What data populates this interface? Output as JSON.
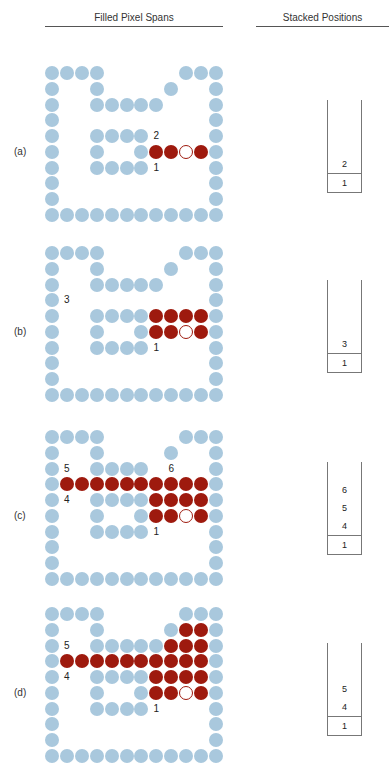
{
  "headers": {
    "left": "Filled Pixel Spans",
    "right": "Stacked Positions"
  },
  "colors": {
    "boundary": "#a9c8dd",
    "filled": "#9e1a0e",
    "seed_outline": "#9e1a0e"
  },
  "grid": {
    "cols": 12,
    "rows": 10
  },
  "boundary_pixels": [
    [
      0,
      0
    ],
    [
      0,
      1
    ],
    [
      0,
      2
    ],
    [
      0,
      3
    ],
    [
      0,
      9
    ],
    [
      0,
      10
    ],
    [
      0,
      11
    ],
    [
      1,
      0
    ],
    [
      1,
      3
    ],
    [
      1,
      8
    ],
    [
      1,
      11
    ],
    [
      2,
      0
    ],
    [
      2,
      3
    ],
    [
      2,
      4
    ],
    [
      2,
      5
    ],
    [
      2,
      6
    ],
    [
      2,
      7
    ],
    [
      2,
      11
    ],
    [
      3,
      0
    ],
    [
      3,
      11
    ],
    [
      4,
      0
    ],
    [
      4,
      3
    ],
    [
      4,
      4
    ],
    [
      4,
      5
    ],
    [
      4,
      6
    ],
    [
      4,
      11
    ],
    [
      5,
      0
    ],
    [
      5,
      3
    ],
    [
      5,
      6
    ],
    [
      5,
      11
    ],
    [
      6,
      0
    ],
    [
      6,
      3
    ],
    [
      6,
      4
    ],
    [
      6,
      5
    ],
    [
      6,
      6
    ],
    [
      6,
      11
    ],
    [
      7,
      0
    ],
    [
      7,
      11
    ],
    [
      8,
      0
    ],
    [
      8,
      11
    ],
    [
      9,
      0
    ],
    [
      9,
      1
    ],
    [
      9,
      2
    ],
    [
      9,
      3
    ],
    [
      9,
      4
    ],
    [
      9,
      5
    ],
    [
      9,
      6
    ],
    [
      9,
      7
    ],
    [
      9,
      8
    ],
    [
      9,
      9
    ],
    [
      9,
      10
    ],
    [
      9,
      11
    ]
  ],
  "panels": [
    {
      "label": "(a)",
      "filled": [
        [
          5,
          7
        ],
        [
          5,
          8
        ],
        [
          5,
          10
        ]
      ],
      "seed": [
        5,
        9
      ],
      "markers": [
        {
          "text": "2",
          "row": 4,
          "col": 7
        },
        {
          "text": "1",
          "row": 6,
          "col": 7
        }
      ],
      "stack": [
        "2",
        "1"
      ]
    },
    {
      "label": "(b)",
      "filled": [
        [
          4,
          7
        ],
        [
          4,
          8
        ],
        [
          4,
          9
        ],
        [
          4,
          10
        ],
        [
          5,
          7
        ],
        [
          5,
          8
        ],
        [
          5,
          10
        ]
      ],
      "seed": [
        5,
        9
      ],
      "markers": [
        {
          "text": "3",
          "row": 3,
          "col": 1
        },
        {
          "text": "1",
          "row": 6,
          "col": 7
        }
      ],
      "stack": [
        "3",
        "1"
      ]
    },
    {
      "label": "(c)",
      "filled": [
        [
          3,
          1
        ],
        [
          3,
          2
        ],
        [
          3,
          3
        ],
        [
          3,
          4
        ],
        [
          3,
          5
        ],
        [
          3,
          6
        ],
        [
          3,
          7
        ],
        [
          3,
          8
        ],
        [
          3,
          9
        ],
        [
          3,
          10
        ],
        [
          4,
          7
        ],
        [
          4,
          8
        ],
        [
          4,
          9
        ],
        [
          4,
          10
        ],
        [
          5,
          7
        ],
        [
          5,
          8
        ],
        [
          5,
          10
        ]
      ],
      "seed": [
        5,
        9
      ],
      "remove_boundary": [
        [
          2,
          7
        ]
      ],
      "markers": [
        {
          "text": "5",
          "row": 2,
          "col": 1
        },
        {
          "text": "6",
          "row": 2,
          "col": 8
        },
        {
          "text": "4",
          "row": 4,
          "col": 1
        },
        {
          "text": "1",
          "row": 6,
          "col": 7
        }
      ],
      "stack": [
        "6",
        "5",
        "4",
        "1"
      ]
    },
    {
      "label": "(d)",
      "filled": [
        [
          1,
          9
        ],
        [
          1,
          10
        ],
        [
          2,
          8
        ],
        [
          2,
          9
        ],
        [
          2,
          10
        ],
        [
          3,
          1
        ],
        [
          3,
          2
        ],
        [
          3,
          3
        ],
        [
          3,
          4
        ],
        [
          3,
          5
        ],
        [
          3,
          6
        ],
        [
          3,
          7
        ],
        [
          3,
          8
        ],
        [
          3,
          9
        ],
        [
          3,
          10
        ],
        [
          4,
          7
        ],
        [
          4,
          8
        ],
        [
          4,
          9
        ],
        [
          4,
          10
        ],
        [
          5,
          7
        ],
        [
          5,
          8
        ],
        [
          5,
          10
        ]
      ],
      "seed": [
        5,
        9
      ],
      "markers": [
        {
          "text": "5",
          "row": 2,
          "col": 1
        },
        {
          "text": "4",
          "row": 4,
          "col": 1
        },
        {
          "text": "1",
          "row": 6,
          "col": 7
        }
      ],
      "stack": [
        "5",
        "4",
        "1"
      ]
    }
  ]
}
